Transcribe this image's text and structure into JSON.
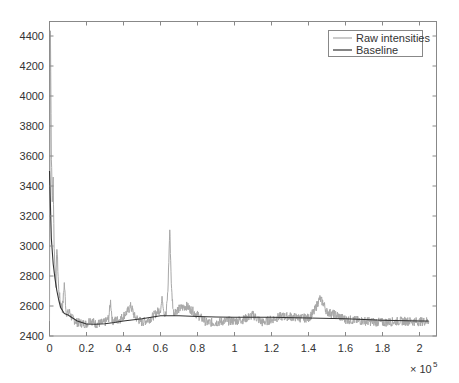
{
  "chart_data": {
    "type": "line",
    "title": "",
    "xlabel": "",
    "ylabel": "",
    "x_exponent_label": "× 10",
    "x_exponent_power": "5",
    "xlim": [
      0,
      2.1
    ],
    "ylim": [
      2400,
      4500
    ],
    "x_ticks": [
      "0",
      "0.2",
      "0.4",
      "0.6",
      "0.8",
      "1",
      "1.2",
      "1.4",
      "1.6",
      "1.8",
      "2"
    ],
    "y_ticks": [
      "2400",
      "2600",
      "2800",
      "3000",
      "3200",
      "3400",
      "3600",
      "3800",
      "4000",
      "4200",
      "4400"
    ],
    "grid": false,
    "legend_position": "upper right",
    "legend": [
      "Raw intensities",
      "Baseline"
    ],
    "colors": {
      "raw": "#a8a8a8",
      "baseline": "#333333",
      "axis": "#888888"
    },
    "series": [
      {
        "name": "Raw intensities",
        "x": [
          0.0,
          0.005,
          0.01,
          0.015,
          0.02,
          0.025,
          0.03,
          0.035,
          0.04,
          0.05,
          0.06,
          0.07,
          0.08,
          0.09,
          0.1,
          0.11,
          0.12,
          0.15,
          0.2,
          0.22,
          0.25,
          0.3,
          0.32,
          0.33,
          0.34,
          0.38,
          0.42,
          0.44,
          0.46,
          0.5,
          0.55,
          0.6,
          0.61,
          0.62,
          0.63,
          0.64,
          0.65,
          0.66,
          0.67,
          0.7,
          0.74,
          0.78,
          0.8,
          0.85,
          0.9,
          0.95,
          1.0,
          1.05,
          1.1,
          1.15,
          1.2,
          1.25,
          1.3,
          1.35,
          1.4,
          1.43,
          1.46,
          1.48,
          1.5,
          1.55,
          1.6,
          1.7,
          1.8,
          1.9,
          2.0,
          2.05
        ],
        "values": [
          2500,
          4450,
          3600,
          3300,
          3450,
          3000,
          2850,
          2750,
          3000,
          2700,
          2620,
          2580,
          2750,
          2560,
          2550,
          2560,
          2520,
          2490,
          2480,
          2510,
          2480,
          2490,
          2520,
          2630,
          2500,
          2510,
          2560,
          2600,
          2530,
          2490,
          2520,
          2580,
          2650,
          2560,
          2540,
          2700,
          3110,
          2700,
          2560,
          2580,
          2600,
          2560,
          2540,
          2490,
          2490,
          2500,
          2500,
          2510,
          2540,
          2490,
          2510,
          2530,
          2530,
          2520,
          2520,
          2560,
          2650,
          2620,
          2560,
          2540,
          2510,
          2500,
          2490,
          2500,
          2495,
          2500
        ]
      },
      {
        "name": "Baseline",
        "x": [
          0.0,
          0.01,
          0.02,
          0.03,
          0.04,
          0.05,
          0.06,
          0.08,
          0.1,
          0.15,
          0.2,
          0.25,
          0.3,
          0.35,
          0.4,
          0.5,
          0.6,
          0.7,
          0.8,
          0.9,
          1.0,
          1.2,
          1.4,
          1.6,
          1.8,
          2.0,
          2.05
        ],
        "values": [
          3500,
          3050,
          2880,
          2780,
          2700,
          2640,
          2590,
          2550,
          2540,
          2500,
          2480,
          2478,
          2482,
          2490,
          2500,
          2515,
          2535,
          2535,
          2530,
          2527,
          2525,
          2525,
          2520,
          2515,
          2505,
          2500,
          2500
        ]
      }
    ]
  }
}
